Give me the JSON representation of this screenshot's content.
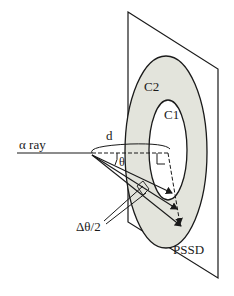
{
  "diagram": {
    "labels": {
      "alpha_ray": "α ray",
      "distance": "d",
      "theta": "θ",
      "delta_theta_half": "Δθ/2",
      "outer_circle": "C2",
      "inner_circle": "C1",
      "detector": "PSSD"
    },
    "colors": {
      "line": "#1a1a1a",
      "ring_fill": "#e3e4dc",
      "background": "#ffffff"
    }
  }
}
